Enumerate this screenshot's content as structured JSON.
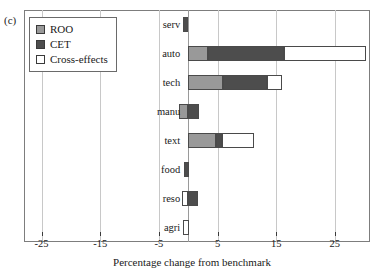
{
  "panel": {
    "label": "(c)"
  },
  "legend": {
    "position": "top-left",
    "items": [
      {
        "label": "ROO",
        "color": "#999999"
      },
      {
        "label": "CET",
        "color": "#4d4d4d"
      },
      {
        "label": "Cross-effects",
        "color": "#ffffff"
      }
    ]
  },
  "axis": {
    "xlabel": "Percentage change from benchmark",
    "ticks": [
      -25,
      -15,
      -5,
      5,
      15,
      25
    ],
    "tick_labels": [
      "-25",
      "-15",
      "-5",
      "5",
      "15",
      "25"
    ],
    "xlim": [
      -28,
      31
    ],
    "zero_line": 0,
    "grid": true
  },
  "chart_data": {
    "type": "bar",
    "orientation": "horizontal",
    "stacked": true,
    "title": "",
    "xlabel": "Percentage change from benchmark",
    "ylabel": "",
    "xlim": [
      -28,
      31
    ],
    "categories": [
      "serv",
      "auto",
      "tech",
      "manu",
      "text",
      "food",
      "reso",
      "agri"
    ],
    "series": [
      {
        "name": "ROO",
        "color": "#999999",
        "values": [
          0.0,
          3.3,
          6.0,
          -1.6,
          4.8,
          0.0,
          -1.0,
          -0.9
        ]
      },
      {
        "name": "CET",
        "color": "#4d4d4d",
        "values": [
          -0.9,
          13.1,
          7.4,
          1.8,
          0.9,
          -0.8,
          1.6,
          0.0
        ]
      },
      {
        "name": "Cross-effects",
        "color": "#ffffff",
        "values": [
          0.0,
          13.9,
          2.6,
          0.0,
          5.5,
          0.0,
          0.0,
          0.1
        ]
      }
    ],
    "bars": [
      {
        "category": "serv",
        "segments": [
          {
            "series": "CET",
            "from": -0.9,
            "to": 0.0
          }
        ]
      },
      {
        "category": "auto",
        "segments": [
          {
            "series": "ROO",
            "from": 0.0,
            "to": 3.3
          },
          {
            "series": "CET",
            "from": 3.3,
            "to": 16.4
          },
          {
            "series": "Cross-effects",
            "from": 16.4,
            "to": 30.3
          }
        ]
      },
      {
        "category": "tech",
        "segments": [
          {
            "series": "ROO",
            "from": 0.0,
            "to": 6.0
          },
          {
            "series": "CET",
            "from": 6.0,
            "to": 13.4
          },
          {
            "series": "Cross-effects",
            "from": 13.4,
            "to": 16.0
          }
        ]
      },
      {
        "category": "manu",
        "segments": [
          {
            "series": "ROO",
            "from": -1.6,
            "to": 0.0
          },
          {
            "series": "CET",
            "from": 0.0,
            "to": 1.8
          }
        ]
      },
      {
        "category": "text",
        "segments": [
          {
            "series": "ROO",
            "from": 0.0,
            "to": 4.8
          },
          {
            "series": "CET",
            "from": 4.8,
            "to": 5.7
          },
          {
            "series": "Cross-effects",
            "from": 5.7,
            "to": 11.2
          }
        ]
      },
      {
        "category": "food",
        "segments": [
          {
            "series": "CET",
            "from": -0.8,
            "to": 0.2
          }
        ]
      },
      {
        "category": "reso",
        "segments": [
          {
            "series": "Cross-effects",
            "from": -1.0,
            "to": 0.0
          },
          {
            "series": "CET",
            "from": 0.0,
            "to": 1.6
          }
        ]
      },
      {
        "category": "agri",
        "segments": [
          {
            "series": "Cross-effects",
            "from": -0.9,
            "to": 0.1
          }
        ]
      }
    ]
  }
}
